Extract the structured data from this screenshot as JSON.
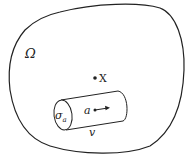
{
  "diagram": {
    "region_label": "Ω",
    "point_label": "X",
    "cylinder_end_label": "σ",
    "cylinder_end_subscript": "a",
    "cylinder_axis_label": "a",
    "cylinder_length_label": "v",
    "colors": {
      "stroke": "#222222",
      "background": "#ffffff"
    }
  }
}
